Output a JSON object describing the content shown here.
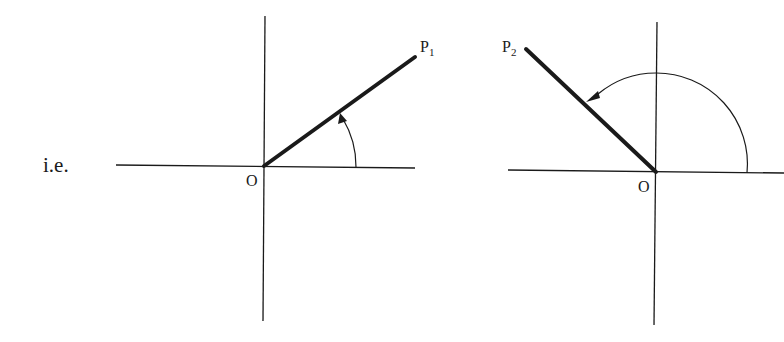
{
  "caption": "i.e.",
  "diagrams": [
    {
      "id": "left",
      "origin_label": "O",
      "point_label": "P",
      "point_subscript": "1",
      "description": "Line OP1 rotated anticlockwise from positive x-axis by an acute angle"
    },
    {
      "id": "right",
      "origin_label": "O",
      "point_label": "P",
      "point_subscript": "2",
      "description": "Line OP2 rotated anticlockwise from positive x-axis by an obtuse angle"
    }
  ],
  "colors": {
    "ink": "#1a1a1a",
    "background": "#ffffff"
  }
}
